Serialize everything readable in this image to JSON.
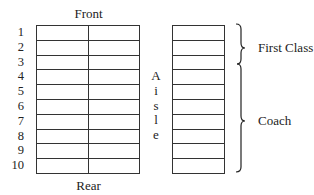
{
  "diagram": {
    "front_label": "Front",
    "rear_label": "Rear",
    "aisle_letters": [
      "A",
      "i",
      "s",
      "l",
      "e"
    ],
    "rows": [
      "1",
      "2",
      "3",
      "4",
      "5",
      "6",
      "7",
      "8",
      "9",
      "10"
    ],
    "sections": [
      {
        "label": "First Class",
        "rows": "1-3"
      },
      {
        "label": "Coach",
        "rows": "4-10"
      }
    ]
  }
}
